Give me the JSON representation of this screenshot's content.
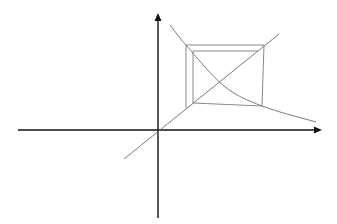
{
  "diagram": {
    "type": "cobweb-diagram",
    "colors": {
      "background": "#ffffff",
      "axes": "#111111",
      "lines": "#6b6b6b",
      "cobweb": "#7a7a7a"
    },
    "axes": {
      "origin": [
        158,
        130
      ],
      "x_axis": {
        "from": [
          18,
          130
        ],
        "to": [
          322,
          130
        ],
        "arrow": "right"
      },
      "y_axis": {
        "from": [
          158,
          218
        ],
        "to": [
          158,
          13
        ],
        "arrow": "up"
      }
    },
    "identity_line": {
      "from": [
        124,
        159
      ],
      "to": [
        279,
        34
      ]
    },
    "curve": {
      "points": [
        [
          170,
          25
        ],
        [
          186,
          45
        ],
        [
          224,
          86
        ],
        [
          262,
          106
        ],
        [
          316,
          122
        ]
      ]
    },
    "cobweb": {
      "segments": [
        [
          [
            186,
            108
          ],
          [
            186,
            45
          ]
        ],
        [
          [
            186,
            45
          ],
          [
            264,
            45
          ]
        ],
        [
          [
            264,
            45
          ],
          [
            262,
            106
          ]
        ],
        [
          [
            262,
            106
          ],
          [
            193,
            103
          ]
        ],
        [
          [
            193,
            103
          ],
          [
            193,
            51
          ]
        ],
        [
          [
            193,
            51
          ],
          [
            258,
            51
          ]
        ]
      ]
    }
  }
}
